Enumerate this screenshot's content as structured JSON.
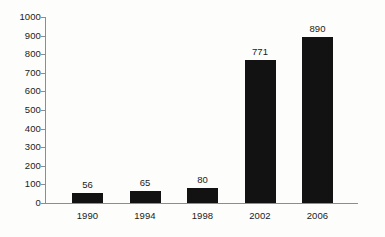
{
  "chart_data": {
    "type": "bar",
    "title": "",
    "subtitle": "",
    "xlabel": "",
    "ylabel": "",
    "categories": [
      "1990",
      "1994",
      "1998",
      "2002",
      "2006"
    ],
    "values": [
      56,
      65,
      80,
      771,
      890
    ],
    "data_labels": [
      "56",
      "65",
      "80",
      "771",
      "890"
    ],
    "ylim": [
      0,
      1000
    ],
    "y_ticks": [
      1000,
      900,
      800,
      700,
      600,
      500,
      400,
      300,
      200,
      100,
      0
    ],
    "y_tick_labels": [
      "1000",
      "900",
      "800",
      "700",
      "600",
      "500",
      "400",
      "300",
      "200",
      "100",
      "0"
    ],
    "grid": false,
    "legend": null,
    "series": [
      {
        "name": "",
        "values": [
          56,
          65,
          80,
          771,
          890
        ]
      }
    ],
    "colors": {
      "bar": "#121212",
      "axis": "#8d8d8d",
      "text": "#1b1b1b",
      "background": "#fdfdfc"
    }
  }
}
